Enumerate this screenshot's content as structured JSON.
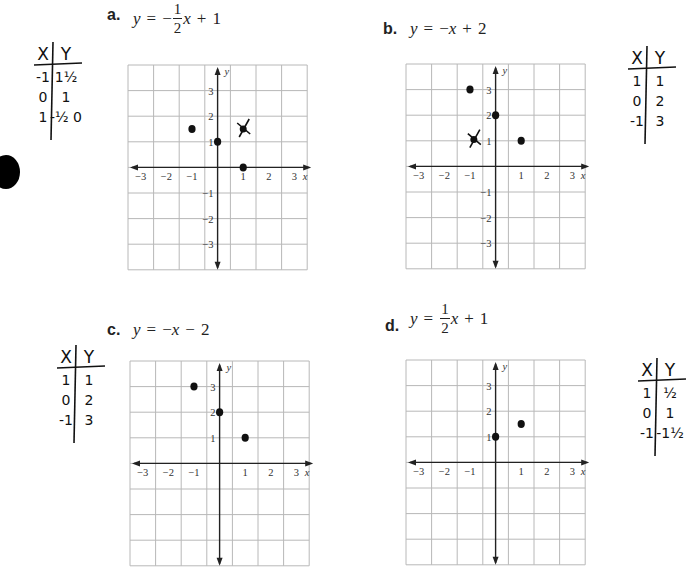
{
  "problems": [
    {
      "id": "a",
      "label": "a.",
      "equation": {
        "lhs": "y",
        "eq": "=",
        "sign": "−",
        "frac_num": "1",
        "frac_den": "2",
        "var": "x",
        "op": "+",
        "const": "1"
      },
      "graph": {
        "origin_col": 4,
        "origin_row": 4,
        "cols": 7,
        "rows": 8,
        "x_ticks": [
          "−3",
          "−2",
          "−1",
          "1",
          "2",
          "3"
        ],
        "y_ticks": [
          "3",
          "2",
          "1",
          "−1",
          "−2",
          "−3"
        ],
        "x_label": "x",
        "y_label": "y",
        "points": [
          {
            "x": -1,
            "y": 1.5
          },
          {
            "x": 0,
            "y": 1
          },
          {
            "x": 1,
            "y": 0
          }
        ],
        "crossed_points": [
          {
            "x": 1,
            "y": 1.5
          }
        ]
      },
      "table": {
        "headers": [
          "X",
          "Y"
        ],
        "rows": [
          [
            "-1",
            "1½"
          ],
          [
            "0",
            "1"
          ],
          [
            "1",
            "-½ 0"
          ]
        ]
      }
    },
    {
      "id": "b",
      "label": "b.",
      "equation": {
        "lhs": "y",
        "eq": "=",
        "sign": "−",
        "var": "x",
        "op": "+",
        "const": "2"
      },
      "graph": {
        "origin_col": 4,
        "origin_row": 4,
        "cols": 7,
        "rows": 8,
        "x_ticks": [
          "−3",
          "−2",
          "−1",
          "1",
          "2",
          "3"
        ],
        "y_ticks": [
          "3",
          "2",
          "1",
          "−1",
          "−2",
          "−3"
        ],
        "x_label": "x",
        "y_label": "y",
        "points": [
          {
            "x": -1,
            "y": 3
          },
          {
            "x": 0,
            "y": 2
          },
          {
            "x": 1,
            "y": 1
          }
        ],
        "crossed_points": [
          {
            "x": -0.85,
            "y": 1.05
          }
        ]
      },
      "table": {
        "headers": [
          "X",
          "Y"
        ],
        "rows": [
          [
            "1",
            "1"
          ],
          [
            "0",
            "2"
          ],
          [
            "-1",
            "3"
          ]
        ]
      }
    },
    {
      "id": "c",
      "label": "c.",
      "equation": {
        "lhs": "y",
        "eq": "=",
        "sign": "−",
        "var": "x",
        "op": "−",
        "const": "2"
      },
      "graph": {
        "origin_col": 4,
        "origin_row": 4,
        "cols": 7,
        "rows": 8,
        "x_ticks": [
          "−3",
          "−2",
          "−1",
          "1",
          "2",
          "3"
        ],
        "y_ticks": [
          "3",
          "2",
          "1"
        ],
        "x_label": "x",
        "y_label": "y",
        "points": [
          {
            "x": -1,
            "y": 3
          },
          {
            "x": 0,
            "y": 2
          },
          {
            "x": 1,
            "y": 1
          }
        ],
        "crossed_points": []
      },
      "table": {
        "headers": [
          "X",
          "Y"
        ],
        "rows": [
          [
            "1",
            "1"
          ],
          [
            "0",
            "2"
          ],
          [
            "-1",
            "3"
          ]
        ]
      }
    },
    {
      "id": "d",
      "label": "d.",
      "equation": {
        "lhs": "y",
        "eq": "=",
        "sign": "",
        "frac_num": "1",
        "frac_den": "2",
        "var": "x",
        "op": "+",
        "const": "1"
      },
      "graph": {
        "origin_col": 4,
        "origin_row": 4,
        "cols": 7,
        "rows": 8,
        "x_ticks": [
          "−3",
          "−2",
          "−1",
          "1",
          "2",
          "3"
        ],
        "y_ticks": [
          "3",
          "2",
          "1"
        ],
        "x_label": "x",
        "y_label": "y",
        "points": [
          {
            "x": 0,
            "y": 1
          },
          {
            "x": 1,
            "y": 1.5
          }
        ],
        "crossed_points": []
      },
      "table": {
        "headers": [
          "X",
          "Y"
        ],
        "rows": [
          [
            "1",
            "½"
          ],
          [
            "0",
            "1"
          ],
          [
            "-1",
            "-1½"
          ]
        ]
      }
    }
  ],
  "colors": {
    "grid": "#b8b8b8",
    "axis": "#222222",
    "ink": "#111111",
    "text": "#222222"
  }
}
